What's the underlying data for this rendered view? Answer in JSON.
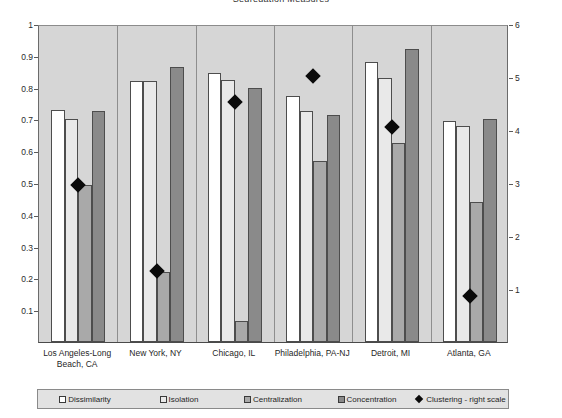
{
  "chart_data": {
    "type": "bar",
    "title": "Segregation Measures",
    "xlabel": "",
    "ylabel": "",
    "ylim": [
      0,
      1
    ],
    "y2lim": [
      0,
      6
    ],
    "grid": false,
    "legend_position": "bottom",
    "categories": [
      "Los Angeles-Long Beach, CA",
      "New York, NY",
      "Chicago, IL",
      "Philadelphia, PA-NJ",
      "Detroit, MI",
      "Atlanta, GA"
    ],
    "category_lines": [
      [
        "Los Angeles-Long",
        "Beach, CA"
      ],
      [
        "New York, NY"
      ],
      [
        "Chicago, IL"
      ],
      [
        "Philadelphia, PA-NJ"
      ],
      [
        "Detroit, MI"
      ],
      [
        "Atlanta, GA"
      ]
    ],
    "series": [
      {
        "name": "Dissimilarity",
        "axis": "left",
        "style": "s0",
        "values": [
          0.73,
          0.82,
          0.845,
          0.775,
          0.88,
          0.695
        ]
      },
      {
        "name": "Isolation",
        "axis": "left",
        "style": "s1",
        "values": [
          0.7,
          0.82,
          0.825,
          0.725,
          0.83,
          0.68
        ]
      },
      {
        "name": "Centralization",
        "axis": "left",
        "style": "s2",
        "values": [
          0.495,
          0.22,
          0.065,
          0.57,
          0.625,
          0.44
        ]
      },
      {
        "name": "Concentration",
        "axis": "left",
        "style": "s3",
        "values": [
          0.725,
          0.865,
          0.8,
          0.715,
          0.92,
          0.7
        ]
      },
      {
        "name": "Clustering - right scale",
        "axis": "right",
        "style": "diamond",
        "values_left_equivalent": [
          0.495,
          0.222,
          0.755,
          0.835,
          0.675,
          0.145
        ],
        "values": [
          2.97,
          1.33,
          4.53,
          5.01,
          4.05,
          0.87
        ]
      }
    ],
    "y_ticks": [
      "0.1",
      "0.2",
      "0.3",
      "0.4",
      "0.5",
      "0.6",
      "0.7",
      "0.8",
      "0.9",
      "1"
    ],
    "y_tick_values": [
      0.1,
      0.2,
      0.3,
      0.4,
      0.5,
      0.6,
      0.7,
      0.8,
      0.9,
      1
    ],
    "y2_ticks": [
      "1",
      "2",
      "3",
      "4",
      "5",
      "6"
    ],
    "y2_tick_values": [
      1,
      2,
      3,
      4,
      5,
      6
    ],
    "legend": [
      {
        "label": "Dissimilarity",
        "style": "s0"
      },
      {
        "label": "Isolation",
        "style": "s1"
      },
      {
        "label": "Centralization",
        "style": "s2"
      },
      {
        "label": "Concentration",
        "style": "s3"
      },
      {
        "label": "Clustering - right scale",
        "style": "diamond"
      }
    ]
  }
}
